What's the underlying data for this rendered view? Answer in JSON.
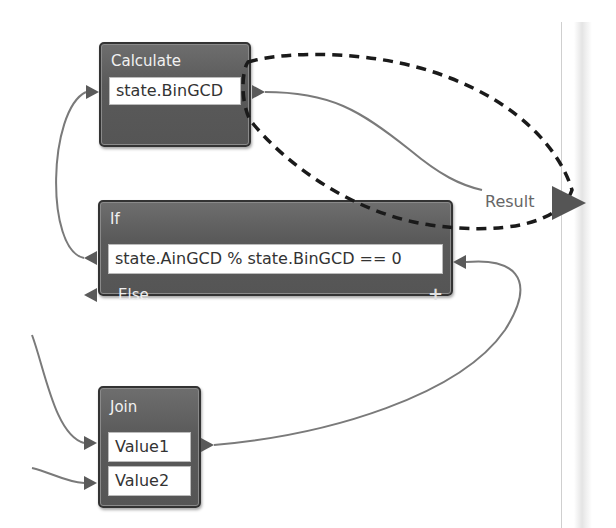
{
  "workflow": {
    "nodes": {
      "calculate": {
        "title": "Calculate",
        "expression": "state.BinGCD"
      },
      "if": {
        "title": "If",
        "condition": "state.AinGCD % state.BinGCD == 0",
        "else_label": "Else",
        "add_icon": "+"
      },
      "join": {
        "title": "Join",
        "inputs": [
          "Value1",
          "Value2"
        ]
      }
    },
    "output": {
      "label": "Result"
    },
    "connections": [
      {
        "from": "calculate.output",
        "to": "result"
      },
      {
        "from": "if.condition",
        "to": "calculate.input"
      },
      {
        "from": "join.output",
        "to": "if.input"
      },
      {
        "from": "external",
        "to": "join.Value1"
      },
      {
        "from": "external",
        "to": "join.Value2"
      }
    ],
    "highlight": {
      "style": "dashed-ellipse",
      "around": [
        "calculate.output",
        "result"
      ]
    }
  },
  "colors": {
    "node_fill": "#5a5a5a",
    "node_border": "#333333",
    "wire": "#7a7a7a",
    "highlight": "#1a1a1a"
  }
}
